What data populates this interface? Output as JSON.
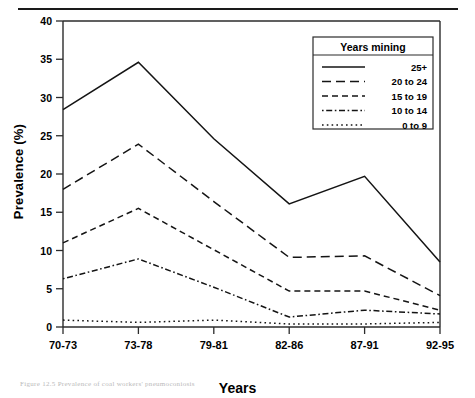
{
  "figure": {
    "xlabel": "Years",
    "ylabel": "Prevalence (%)",
    "legend_title": "Years mining",
    "caption": "Figure 12.5 Prevalence of coal workers' pneumoconiosis"
  },
  "chart_data": {
    "type": "line",
    "title": "",
    "xlabel": "Years",
    "ylabel": "Prevalence (%)",
    "categories": [
      "70-73",
      "73-78",
      "79-81",
      "82-86",
      "87-91",
      "92-95"
    ],
    "ylim": [
      0,
      40
    ],
    "yticks": [
      0,
      5,
      10,
      15,
      20,
      25,
      30,
      35,
      40
    ],
    "grid": false,
    "legend_position": "top-right",
    "legend_title": "Years mining",
    "series": [
      {
        "name": "25+",
        "dash": "solid",
        "values": [
          28.4,
          34.6,
          24.6,
          16.1,
          19.7,
          8.5
        ]
      },
      {
        "name": "20 to 24",
        "dash": "long-dash",
        "values": [
          18.0,
          23.9,
          16.4,
          9.1,
          9.3,
          4.1
        ]
      },
      {
        "name": "15 to 19",
        "dash": "dash",
        "values": [
          11.0,
          15.5,
          10.1,
          4.7,
          4.7,
          2.2
        ]
      },
      {
        "name": "10 to 14",
        "dash": "dash-dot",
        "values": [
          6.3,
          8.9,
          5.2,
          1.3,
          2.2,
          1.7
        ]
      },
      {
        "name": "0 to 9",
        "dash": "dot",
        "values": [
          0.9,
          0.6,
          0.9,
          0.4,
          0.4,
          0.6
        ]
      }
    ]
  }
}
